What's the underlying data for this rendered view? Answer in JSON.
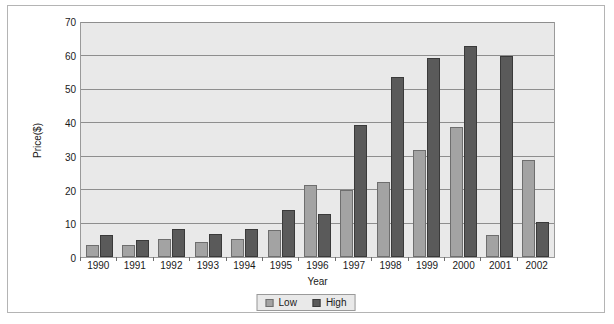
{
  "chart_data": {
    "type": "bar",
    "title": "",
    "xlabel": "Year",
    "ylabel": "Price($)",
    "categories": [
      "1990",
      "1991",
      "1992",
      "1993",
      "1994",
      "1995",
      "1996",
      "1997",
      "1998",
      "1999",
      "2000",
      "2001",
      "2002"
    ],
    "series": [
      {
        "name": "Low",
        "color": "#a3a3a3",
        "values": [
          3.5,
          3.5,
          5.5,
          4.5,
          5.5,
          8,
          21.5,
          20,
          22.5,
          32,
          39,
          6.5,
          29
        ]
      },
      {
        "name": "High",
        "color": "#5a5a5a",
        "values": [
          6.5,
          5,
          8.5,
          7,
          8.5,
          14,
          13,
          39.5,
          54,
          59.5,
          63,
          60,
          10.5
        ]
      }
    ],
    "ylim": [
      0,
      70
    ],
    "yticks": [
      0,
      10,
      20,
      30,
      40,
      50,
      60,
      70
    ],
    "ytick_labels": [
      "0",
      "10",
      "20",
      "30",
      "40",
      "50",
      "60",
      "70"
    ],
    "grid": true,
    "legend_position": "bottom",
    "plot_background": "#e9e9e9",
    "gridline_color": "#8e8e8e"
  },
  "legend": {
    "items": [
      {
        "label": "Low"
      },
      {
        "label": "High"
      }
    ]
  }
}
